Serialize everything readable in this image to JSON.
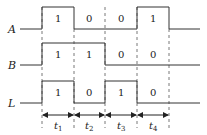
{
  "diagram": {
    "type": "timing-diagram",
    "signals": [
      {
        "name": "A",
        "values": [
          "1",
          "0",
          "0",
          "1"
        ]
      },
      {
        "name": "B",
        "values": [
          "1",
          "1",
          "0",
          "0"
        ]
      },
      {
        "name": "L",
        "values": [
          "1",
          "0",
          "1",
          "0"
        ]
      }
    ],
    "intervals": [
      {
        "label": "t",
        "sub": "1"
      },
      {
        "label": "t",
        "sub": "2"
      },
      {
        "label": "t",
        "sub": "3"
      },
      {
        "label": "t",
        "sub": "4"
      }
    ],
    "colors": {
      "line": "#333333",
      "dash": "#555555"
    }
  }
}
